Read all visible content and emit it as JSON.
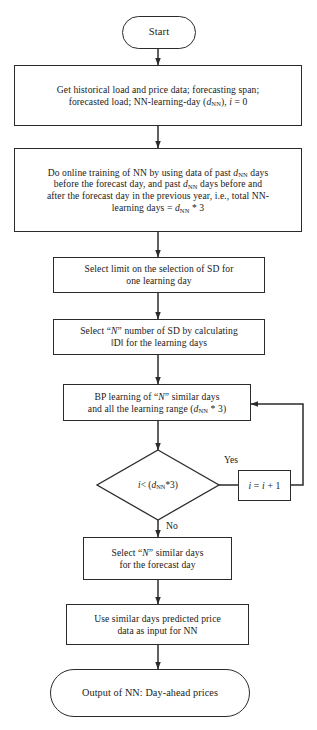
{
  "diagram": {
    "type": "flowchart",
    "orientation": "top-to-bottom",
    "colors": {
      "stroke": "#2b2b2b",
      "fill": "#ffffff",
      "text": "#1a1a1a"
    }
  },
  "nodes": {
    "start": {
      "id": "start",
      "shape": "terminator",
      "text": "Start"
    },
    "get_data": {
      "id": "get_data",
      "shape": "process",
      "line1": "Get historical load and price data; forecasting span;",
      "line2_a": "forecasted load; NN-learning-day (",
      "line2_var": "d",
      "line2_sub": "NN",
      "line2_b": "), ",
      "line2_i": "i",
      "line2_c": " = 0",
      "text": "Get historical load and price data; forecasting span; forecasted load; NN-learning-day (dNN), i = 0"
    },
    "online_training": {
      "id": "online_training",
      "shape": "process",
      "l1_a": "Do online training of NN by using data of past ",
      "l1_var": "d",
      "l1_sub": "NN",
      "l1_b": " days",
      "l2_a": "before the forecast day, and past ",
      "l2_var": "d",
      "l2_sub": "NN",
      "l2_b": " days before and",
      "l3": "after the forecast day in the previous year, i.e., total NN-",
      "l4_a": "learning days = ",
      "l4_var": "d",
      "l4_sub": "NN",
      "l4_b": " * 3",
      "text": "Do online training of NN by using data of past dNN days before the forecast day, and past dNN days before and after the forecast day in the previous year, i.e., total NN-learning days = dNN * 3"
    },
    "select_limit": {
      "id": "select_limit",
      "shape": "process",
      "line1": "Select limit on the selection of SD for",
      "line2": "one learning day",
      "text": "Select limit on the selection of SD for one learning day"
    },
    "select_n_sd": {
      "id": "select_n_sd",
      "shape": "process",
      "l1_a": "Select “",
      "l1_var": "N",
      "l1_b": "” number of SD by calculating",
      "line2": "‖D‖ for the learning days",
      "text": "Select “N” number of SD by calculating ‖D‖ for the learning days"
    },
    "bp_learning": {
      "id": "bp_learning",
      "shape": "process",
      "l1_a": "BP learning of “",
      "l1_var": "N",
      "l1_b": "” similar days",
      "l2_a": "and all the learning range (",
      "l2_var": "d",
      "l2_sub": "NN",
      "l2_b": " * 3)",
      "text": "BP learning of “N” similar days and all the learning range (dNN * 3)"
    },
    "decision": {
      "id": "decision",
      "shape": "decision",
      "cond_i": "i",
      "cond_op": " < ( ",
      "cond_var": "d",
      "cond_sub": "NN",
      "cond_tail": " *3)",
      "text": "i < ( dNN *3)"
    },
    "increment": {
      "id": "increment",
      "shape": "process",
      "var_i": "i",
      "eq": " = ",
      "var_i2": "i",
      "plus": " + 1",
      "text": "i = i + 1"
    },
    "select_similar": {
      "id": "select_similar",
      "shape": "process",
      "l1_a": "Select “",
      "l1_var": "N",
      "l1_b": "” similar days",
      "line2": "for the forecast day",
      "text": "Select “N” similar days for the forecast day"
    },
    "use_similar": {
      "id": "use_similar",
      "shape": "process",
      "line1": "Use similar days predicted price",
      "line2": "data as input for NN",
      "text": "Use similar days predicted price data as input for NN"
    },
    "output": {
      "id": "output",
      "shape": "terminator",
      "text": "Output of NN: Day-ahead prices"
    }
  },
  "edge_labels": {
    "yes": "Yes",
    "no": "No"
  },
  "edges": [
    {
      "from": "start",
      "to": "get_data",
      "label": ""
    },
    {
      "from": "get_data",
      "to": "online_training",
      "label": ""
    },
    {
      "from": "online_training",
      "to": "select_limit",
      "label": ""
    },
    {
      "from": "select_limit",
      "to": "select_n_sd",
      "label": ""
    },
    {
      "from": "select_n_sd",
      "to": "bp_learning",
      "label": ""
    },
    {
      "from": "bp_learning",
      "to": "decision",
      "label": ""
    },
    {
      "from": "decision",
      "to": "increment",
      "label": "Yes"
    },
    {
      "from": "increment",
      "to": "bp_learning",
      "label": ""
    },
    {
      "from": "decision",
      "to": "select_similar",
      "label": "No"
    },
    {
      "from": "select_similar",
      "to": "use_similar",
      "label": ""
    },
    {
      "from": "use_similar",
      "to": "output",
      "label": ""
    }
  ]
}
